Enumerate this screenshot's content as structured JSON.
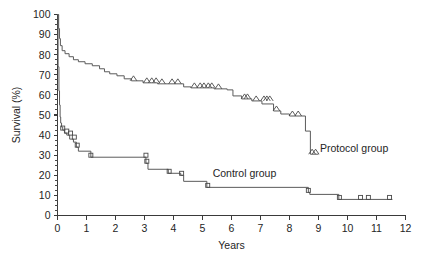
{
  "chart_data": {
    "type": "line",
    "title": "",
    "subtitle": "",
    "xlabel": "Years",
    "ylabel": "Survival (%)",
    "xlim": [
      0,
      12
    ],
    "ylim": [
      0,
      100
    ],
    "grid": false,
    "legend_position": "inline-annotation",
    "x_ticks": [
      "0",
      "1",
      "2",
      "3",
      "4",
      "5",
      "6",
      "7",
      "8",
      "9",
      "10",
      "11",
      "12"
    ],
    "x_tick_values": [
      0,
      1,
      2,
      3,
      4,
      5,
      6,
      7,
      8,
      9,
      10,
      11,
      12
    ],
    "y_ticks": [
      "0",
      "10",
      "20",
      "30",
      "40",
      "50",
      "60",
      "70",
      "80",
      "90",
      "100"
    ],
    "y_tick_values": [
      0,
      10,
      20,
      30,
      40,
      50,
      60,
      70,
      80,
      90,
      100
    ],
    "y_minor_step": 2.5,
    "annotations": [
      {
        "text": "Protocol group",
        "x": 9.05,
        "y": 31.5
      },
      {
        "text": "Control group",
        "x": 5.35,
        "y": 19.0
      }
    ],
    "series": [
      {
        "name": "Protocol group",
        "label": "Protocol group",
        "censor_marker": "triangle",
        "color": "#5b5b5b",
        "steps": [
          [
            0.0,
            100.0
          ],
          [
            0.04,
            100.0
          ],
          [
            0.04,
            93.0
          ],
          [
            0.07,
            93.0
          ],
          [
            0.07,
            88.0
          ],
          [
            0.1,
            88.0
          ],
          [
            0.1,
            84.5
          ],
          [
            0.16,
            84.5
          ],
          [
            0.16,
            82.0
          ],
          [
            0.26,
            82.0
          ],
          [
            0.26,
            80.5
          ],
          [
            0.4,
            80.5
          ],
          [
            0.4,
            79.0
          ],
          [
            0.55,
            79.0
          ],
          [
            0.55,
            77.5
          ],
          [
            0.72,
            77.5
          ],
          [
            0.72,
            76.5
          ],
          [
            0.95,
            76.5
          ],
          [
            0.95,
            75.5
          ],
          [
            1.2,
            75.5
          ],
          [
            1.2,
            74.5
          ],
          [
            1.45,
            74.5
          ],
          [
            1.45,
            73.0
          ],
          [
            1.62,
            73.0
          ],
          [
            1.62,
            71.5
          ],
          [
            1.8,
            71.5
          ],
          [
            1.8,
            70.5
          ],
          [
            2.05,
            70.5
          ],
          [
            2.05,
            69.5
          ],
          [
            2.3,
            69.5
          ],
          [
            2.3,
            68.0
          ],
          [
            2.55,
            68.0
          ],
          [
            2.55,
            67.0
          ],
          [
            2.95,
            67.0
          ],
          [
            2.95,
            66.0
          ],
          [
            3.45,
            66.0
          ],
          [
            3.45,
            65.5
          ],
          [
            4.35,
            65.5
          ],
          [
            4.35,
            64.0
          ],
          [
            4.6,
            64.0
          ],
          [
            4.6,
            63.5
          ],
          [
            5.4,
            63.5
          ],
          [
            5.4,
            63.0
          ],
          [
            5.85,
            63.0
          ],
          [
            5.85,
            62.5
          ],
          [
            6.05,
            62.5
          ],
          [
            6.05,
            59.5
          ],
          [
            6.35,
            59.5
          ],
          [
            6.35,
            58.0
          ],
          [
            6.7,
            58.0
          ],
          [
            6.7,
            57.0
          ],
          [
            7.05,
            57.0
          ],
          [
            7.05,
            55.5
          ],
          [
            7.45,
            55.5
          ],
          [
            7.45,
            52.0
          ],
          [
            7.7,
            52.0
          ],
          [
            7.7,
            50.5
          ],
          [
            8.0,
            50.5
          ],
          [
            8.0,
            49.5
          ],
          [
            8.55,
            49.5
          ],
          [
            8.55,
            42.0
          ],
          [
            8.72,
            42.0
          ],
          [
            8.72,
            30.5
          ],
          [
            9.0,
            30.5
          ]
        ],
        "censors": [
          [
            2.62,
            67.0
          ],
          [
            3.08,
            66.0
          ],
          [
            3.25,
            66.0
          ],
          [
            3.4,
            66.0
          ],
          [
            3.6,
            65.5
          ],
          [
            3.95,
            65.5
          ],
          [
            4.15,
            65.5
          ],
          [
            4.72,
            63.5
          ],
          [
            4.92,
            63.5
          ],
          [
            5.05,
            63.5
          ],
          [
            5.2,
            63.5
          ],
          [
            5.32,
            63.5
          ],
          [
            5.55,
            63.0
          ],
          [
            6.45,
            58.0
          ],
          [
            6.55,
            58.0
          ],
          [
            6.85,
            57.0
          ],
          [
            7.12,
            57.0
          ],
          [
            7.22,
            57.0
          ],
          [
            7.32,
            57.0
          ],
          [
            7.55,
            52.0
          ],
          [
            8.1,
            49.5
          ],
          [
            8.3,
            49.5
          ],
          [
            8.78,
            30.5
          ],
          [
            8.9,
            30.5
          ]
        ]
      },
      {
        "name": "Control group",
        "label": "Control group",
        "censor_marker": "square",
        "color": "#5b5b5b",
        "steps": [
          [
            0.0,
            100.0
          ],
          [
            0.02,
            100.0
          ],
          [
            0.02,
            74.0
          ],
          [
            0.05,
            74.0
          ],
          [
            0.05,
            62.0
          ],
          [
            0.07,
            62.0
          ],
          [
            0.07,
            55.0
          ],
          [
            0.09,
            55.0
          ],
          [
            0.09,
            49.0
          ],
          [
            0.11,
            49.0
          ],
          [
            0.11,
            46.0
          ],
          [
            0.14,
            46.0
          ],
          [
            0.14,
            44.0
          ],
          [
            0.18,
            44.0
          ],
          [
            0.18,
            42.5
          ],
          [
            0.24,
            42.5
          ],
          [
            0.24,
            41.0
          ],
          [
            0.32,
            41.0
          ],
          [
            0.32,
            40.0
          ],
          [
            0.42,
            40.0
          ],
          [
            0.42,
            38.0
          ],
          [
            0.55,
            38.0
          ],
          [
            0.55,
            36.5
          ],
          [
            0.65,
            36.5
          ],
          [
            0.65,
            34.0
          ],
          [
            0.72,
            34.0
          ],
          [
            0.72,
            32.0
          ],
          [
            1.15,
            32.0
          ],
          [
            1.15,
            29.0
          ],
          [
            3.05,
            29.0
          ],
          [
            3.05,
            26.0
          ],
          [
            3.12,
            26.0
          ],
          [
            3.12,
            23.0
          ],
          [
            3.82,
            23.0
          ],
          [
            3.82,
            21.0
          ],
          [
            4.25,
            21.0
          ],
          [
            4.25,
            20.0
          ],
          [
            4.35,
            20.0
          ],
          [
            4.35,
            17.0
          ],
          [
            5.15,
            17.0
          ],
          [
            5.15,
            14.0
          ],
          [
            8.65,
            14.0
          ],
          [
            8.65,
            11.5
          ],
          [
            8.7,
            11.5
          ],
          [
            8.7,
            10.5
          ],
          [
            9.7,
            10.5
          ],
          [
            9.7,
            8.0
          ],
          [
            11.55,
            8.0
          ]
        ],
        "censors": [
          [
            0.18,
            42.5
          ],
          [
            0.32,
            41.0
          ],
          [
            0.45,
            40.0
          ],
          [
            0.58,
            38.0
          ],
          [
            0.68,
            34.0
          ],
          [
            1.15,
            29.0
          ],
          [
            3.05,
            29.0
          ],
          [
            3.08,
            26.0
          ],
          [
            3.85,
            21.0
          ],
          [
            4.28,
            20.0
          ],
          [
            5.18,
            14.0
          ],
          [
            8.65,
            11.5
          ],
          [
            9.72,
            8.0
          ],
          [
            10.45,
            8.0
          ],
          [
            10.72,
            8.0
          ],
          [
            11.45,
            8.0
          ]
        ]
      }
    ]
  }
}
